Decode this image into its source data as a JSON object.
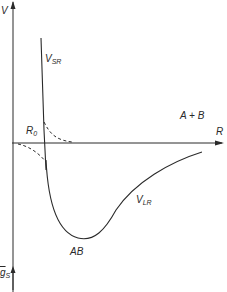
{
  "diagram": {
    "type": "potential-energy-curve",
    "axes": {
      "y_axis_label": "V",
      "x_axis_label": "R",
      "lower_axis_label_main": "g",
      "lower_axis_label_sub": "S"
    },
    "labels": {
      "short_range_main": "V",
      "short_range_sub": "SR",
      "long_range_main": "V",
      "long_range_sub": "LR",
      "r0_main": "R",
      "r0_sub": "0",
      "dissociated": "A + B",
      "bound_state": "AB"
    },
    "colors": {
      "line": "#2a2a2a",
      "background": "#ffffff"
    }
  }
}
